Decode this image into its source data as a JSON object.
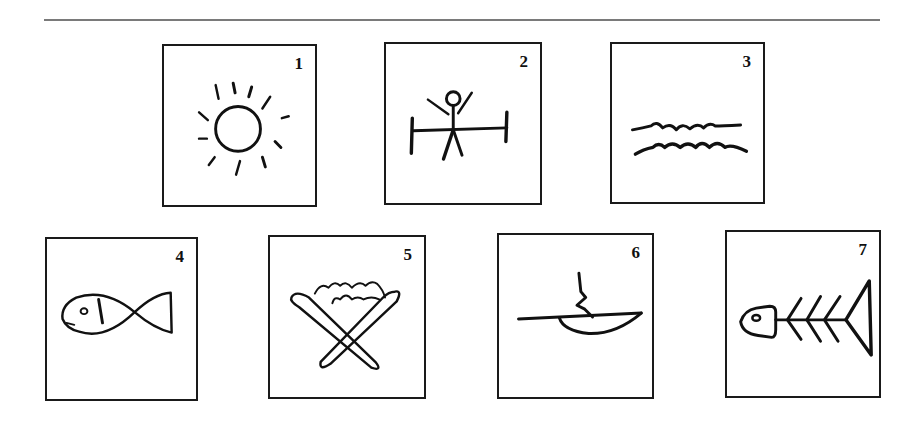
{
  "figure": {
    "cards": [
      {
        "number": "1",
        "icon": "sun-icon"
      },
      {
        "number": "2",
        "icon": "stick-figure-on-bar-icon"
      },
      {
        "number": "3",
        "icon": "water-waves-icon"
      },
      {
        "number": "4",
        "icon": "fish-icon"
      },
      {
        "number": "5",
        "icon": "crossed-sticks-with-flames-icon"
      },
      {
        "number": "6",
        "icon": "cooking-pan-with-steam-icon"
      },
      {
        "number": "7",
        "icon": "fish-skeleton-icon"
      }
    ]
  }
}
